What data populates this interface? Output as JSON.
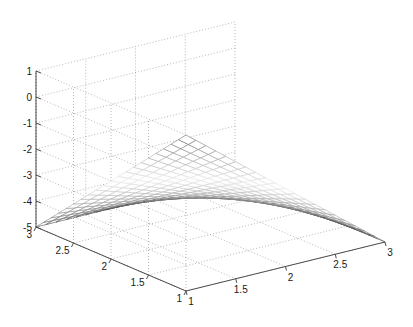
{
  "figure": {
    "title": "",
    "background_color": "#ffffff",
    "width": 413,
    "height": 327
  },
  "axes": {
    "z": {
      "name": "z-axis",
      "ticks": [
        "1",
        "0",
        "-1",
        "-2",
        "-3",
        "-4",
        "-5"
      ],
      "values": [
        1,
        0,
        -1,
        -2,
        -3,
        -4,
        -5
      ],
      "range": [
        -5,
        1
      ],
      "label": ""
    },
    "y": {
      "name": "y-axis",
      "ticks": [
        "3",
        "2.5",
        "2",
        "1.5",
        "1"
      ],
      "values": [
        3,
        2.5,
        2,
        1.5,
        1
      ],
      "range": [
        1,
        3
      ],
      "label": ""
    },
    "x": {
      "name": "x-axis",
      "ticks": [
        "1",
        "1.5",
        "2",
        "2.5",
        "3"
      ],
      "values": [
        1,
        1.5,
        2,
        2.5,
        3
      ],
      "range": [
        1,
        3
      ],
      "label": ""
    }
  },
  "style": {
    "axis_color": "#4d4d4d",
    "grid_color": "#999999",
    "tick_label_color": "#1a1a1a",
    "mesh_dark_color": "#4a4a4a",
    "mesh_light_color": "#e8e8e8",
    "grid_dashed": true
  },
  "chart_data": {
    "type": "surface",
    "title": "",
    "xlabel": "",
    "ylabel": "",
    "zlabel": "",
    "xlim": [
      1,
      3
    ],
    "ylim": [
      1,
      3
    ],
    "zlim": [
      -5,
      1
    ],
    "xticks": [
      1,
      1.5,
      2,
      2.5,
      3
    ],
    "yticks": [
      1,
      1.5,
      2,
      2.5,
      3
    ],
    "zticks": [
      -5,
      -4,
      -3,
      -2,
      -1,
      0,
      1
    ],
    "grid": true,
    "legend": null,
    "mesh_rows": 21,
    "mesh_cols": 21,
    "colormap": "gray",
    "corner_values": {
      "x1_y3": 1.0,
      "x1_y1": -2.0,
      "x3_y3": -5.0,
      "x3_y1": -2.0
    },
    "x": [
      1,
      1.1,
      1.2,
      1.3,
      1.4,
      1.5,
      1.6,
      1.7,
      1.8,
      1.9,
      2,
      2.1,
      2.2,
      2.3,
      2.4,
      2.5,
      2.6,
      2.7,
      2.8,
      2.9,
      3
    ],
    "y": [
      1,
      1.1,
      1.2,
      1.3,
      1.4,
      1.5,
      1.6,
      1.7,
      1.8,
      1.9,
      2,
      2.1,
      2.2,
      2.3,
      2.4,
      2.5,
      2.6,
      2.7,
      2.8,
      2.9,
      3
    ],
    "z_formula": "z = 1 - 3*(x-1) - 3*(y-1) + 1.5*(x-1)*(y-1)",
    "z_row_endpoints": [
      {
        "y": 3.0,
        "z_at_x1": 1.0,
        "z_at_x3": -5.0
      },
      {
        "y": 2.5,
        "z_at_x1": 0.25,
        "z_at_x3": -4.25
      },
      {
        "y": 2.0,
        "z_at_x1": -0.5,
        "z_at_x3": -3.5
      },
      {
        "y": 1.5,
        "z_at_x1": -1.25,
        "z_at_x3": -2.75
      },
      {
        "y": 1.0,
        "z_at_x1": -2.0,
        "z_at_x3": -2.0
      }
    ]
  }
}
